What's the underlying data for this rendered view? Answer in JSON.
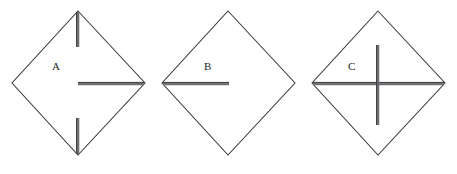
{
  "figure": {
    "background_color": "#ffffff",
    "outline_color": "#3a3a3c",
    "fold_color": "#6f6f74",
    "label_color": "#1d1d1f",
    "canvas": {
      "width": 457,
      "height": 174
    },
    "panels": [
      {
        "id": "panel-a",
        "label": "A",
        "label_position": {
          "x": 52,
          "y": 70
        },
        "diamond": {
          "top": {
            "x": 78,
            "y": 11
          },
          "right": {
            "x": 145,
            "y": 83
          },
          "bottom": {
            "x": 78,
            "y": 155
          },
          "left": {
            "x": 12,
            "y": 83
          }
        },
        "fold_lines": [
          {
            "name": "upper-vertical-fold",
            "orientation": "vertical",
            "x1": 78,
            "y1": 11,
            "x2": 78,
            "y2": 48
          },
          {
            "name": "lower-vertical-fold",
            "orientation": "vertical",
            "x1": 78,
            "y1": 118,
            "x2": 78,
            "y2": 155
          },
          {
            "name": "right-horizontal-fold",
            "orientation": "horizontal",
            "x1": 78,
            "y1": 84,
            "x2": 145,
            "y2": 84
          }
        ]
      },
      {
        "id": "panel-b",
        "label": "B",
        "label_position": {
          "x": 204,
          "y": 70
        },
        "diamond": {
          "top": {
            "x": 228,
            "y": 11
          },
          "right": {
            "x": 295,
            "y": 83
          },
          "bottom": {
            "x": 228,
            "y": 155
          },
          "left": {
            "x": 162,
            "y": 83
          }
        },
        "fold_lines": [
          {
            "name": "left-horizontal-fold",
            "orientation": "horizontal",
            "x1": 162,
            "y1": 83,
            "x2": 229,
            "y2": 83
          }
        ]
      },
      {
        "id": "panel-c",
        "label": "C",
        "label_position": {
          "x": 348,
          "y": 70
        },
        "diamond": {
          "top": {
            "x": 378,
            "y": 11
          },
          "right": {
            "x": 445,
            "y": 83
          },
          "bottom": {
            "x": 378,
            "y": 155
          },
          "left": {
            "x": 312,
            "y": 83
          }
        },
        "fold_lines": [
          {
            "name": "full-horizontal-fold",
            "orientation": "horizontal",
            "x1": 312,
            "y1": 84,
            "x2": 445,
            "y2": 84
          },
          {
            "name": "central-vertical-fold",
            "orientation": "vertical",
            "x1": 378,
            "y1": 45,
            "x2": 378,
            "y2": 125
          }
        ]
      }
    ]
  }
}
